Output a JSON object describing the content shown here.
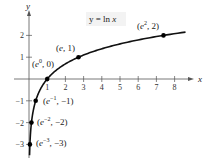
{
  "chart_data": {
    "type": "line",
    "title": "",
    "equation_label": "y = ln x",
    "xlabel": "x",
    "ylabel": "y",
    "xlim": [
      0,
      8.8
    ],
    "ylim": [
      -3.4,
      2.6
    ],
    "x_ticks": [
      "1",
      "2",
      "3",
      "4",
      "5",
      "6",
      "7",
      "8"
    ],
    "y_ticks": [
      "2",
      "1",
      "-1",
      "-2",
      "-3"
    ],
    "series": [
      {
        "name": "y = ln x",
        "function": "ln(x)",
        "x_range": [
          0.0498,
          8.6
        ]
      }
    ],
    "points": [
      {
        "x": 0.0498,
        "y": -3,
        "label": "(e^-3, -3)"
      },
      {
        "x": 0.1353,
        "y": -2,
        "label": "(e^-2, -2)"
      },
      {
        "x": 0.3679,
        "y": -1,
        "label": "(e^-1, -1)"
      },
      {
        "x": 1,
        "y": 0,
        "label": "(e^0, 0)"
      },
      {
        "x": 2.7183,
        "y": 1,
        "label": "(e, 1)"
      },
      {
        "x": 7.389,
        "y": 2,
        "label": "(e^2, 2)"
      }
    ],
    "grid": false,
    "legend": "none"
  },
  "labels": {
    "equation": "y = ln x",
    "x_axis": "x",
    "y_axis": "y",
    "xticks": [
      "1",
      "2",
      "3",
      "4",
      "5",
      "6",
      "7",
      "8"
    ],
    "yticks": [
      "2",
      "1",
      "−1",
      "−2",
      "−3"
    ]
  }
}
